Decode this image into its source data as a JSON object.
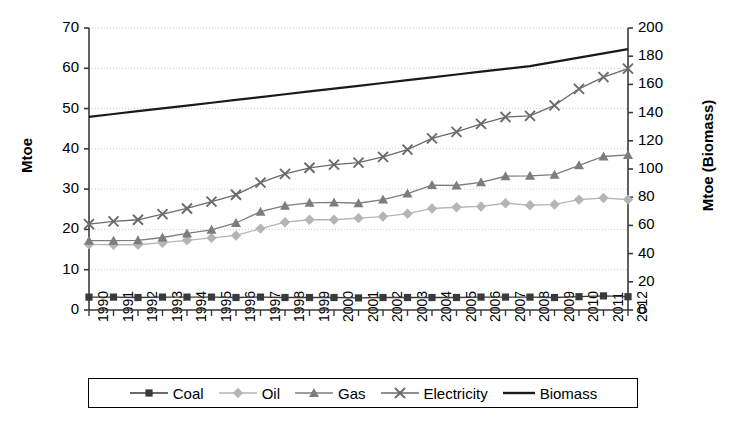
{
  "chart_data": {
    "type": "line",
    "title": "",
    "xlabel": "",
    "ylabel": "Mtoe",
    "ylabel_secondary": "Mtoe (Biomass)",
    "ylim": [
      0,
      70
    ],
    "ylim_secondary": [
      0,
      200
    ],
    "yticks": [
      0,
      10,
      20,
      30,
      40,
      50,
      60,
      70
    ],
    "yticks_secondary": [
      0,
      20,
      40,
      60,
      80,
      100,
      120,
      140,
      160,
      180,
      200
    ],
    "grid": true,
    "legend_position": "bottom",
    "x": [
      1990,
      1991,
      1992,
      1993,
      1994,
      1995,
      1996,
      1997,
      1998,
      1999,
      2000,
      2001,
      2002,
      2003,
      2004,
      2005,
      2006,
      2007,
      2008,
      2009,
      2010,
      2011,
      2012
    ],
    "categories": [
      "1990",
      "1991",
      "1992",
      "1993",
      "1994",
      "1995",
      "1996",
      "1997",
      "1998",
      "1999",
      "2000",
      "2001",
      "2002",
      "2003",
      "2004",
      "2005",
      "2006",
      "2007",
      "2008",
      "2009",
      "2010",
      "2011",
      "2012"
    ],
    "series": [
      {
        "name": "Coal",
        "axis": "left",
        "marker": "square",
        "color": "#3a3a3a",
        "values": [
          3.2,
          3.2,
          3.1,
          3.2,
          3.2,
          3.2,
          3.1,
          3.2,
          3.1,
          3.1,
          3.1,
          3.0,
          3.1,
          3.1,
          3.1,
          3.1,
          3.2,
          3.2,
          3.2,
          3.1,
          3.3,
          3.5,
          3.3
        ]
      },
      {
        "name": "Oil",
        "axis": "left",
        "marker": "diamond",
        "color": "#b5b5b5",
        "values": [
          16.3,
          16.2,
          16.2,
          16.7,
          17.3,
          17.9,
          18.5,
          20.2,
          21.8,
          22.4,
          22.4,
          22.8,
          23.2,
          23.9,
          25.2,
          25.5,
          25.7,
          26.5,
          26.0,
          26.2,
          27.4,
          27.8,
          27.4
        ]
      },
      {
        "name": "Gas",
        "axis": "left",
        "marker": "triangle",
        "color": "#7d7d7d",
        "values": [
          17.2,
          17.2,
          17.3,
          18.0,
          19.0,
          19.9,
          21.6,
          24.4,
          25.9,
          26.6,
          26.7,
          26.5,
          27.4,
          28.9,
          31.0,
          30.9,
          31.7,
          33.2,
          33.3,
          33.6,
          35.9,
          38.1,
          38.5
        ]
      },
      {
        "name": "Electricity",
        "axis": "left",
        "marker": "cross",
        "color": "#6b6b6b",
        "values": [
          21.3,
          22.0,
          22.4,
          23.8,
          25.2,
          26.9,
          28.6,
          31.6,
          33.8,
          35.3,
          36.1,
          36.6,
          38.0,
          39.8,
          42.6,
          44.2,
          46.2,
          47.9,
          48.2,
          50.8,
          54.9,
          57.8,
          59.9
        ]
      },
      {
        "name": "Biomass",
        "axis": "right",
        "marker": "none",
        "color": "#1a1a1a",
        "values": [
          137,
          139,
          141,
          143,
          145,
          147,
          149,
          151,
          153,
          155,
          157,
          159,
          161,
          163,
          165,
          167,
          169,
          171,
          173,
          176,
          179,
          182,
          185
        ]
      }
    ]
  },
  "legend": {
    "items": [
      {
        "label": "Coal"
      },
      {
        "label": "Oil"
      },
      {
        "label": "Gas"
      },
      {
        "label": "Electricity"
      },
      {
        "label": "Biomass"
      }
    ]
  }
}
